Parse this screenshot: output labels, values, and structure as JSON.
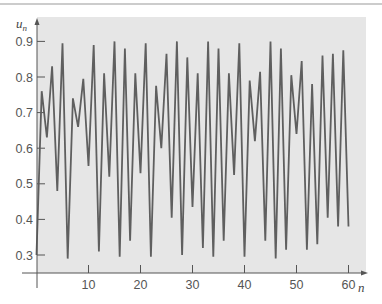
{
  "page": {
    "header_rule_color": "#9a9a9a"
  },
  "chart_data": {
    "type": "line",
    "title": "",
    "xlabel": "n",
    "ylabel": "u_n",
    "ylabel_main": "u",
    "ylabel_sub": "n",
    "xlim": [
      0,
      62
    ],
    "ylim": [
      0.25,
      0.96
    ],
    "x_ticks": [
      10,
      20,
      30,
      40,
      50,
      60
    ],
    "x_tick_labels": [
      "10",
      "20",
      "30",
      "40",
      "50",
      "60"
    ],
    "y_ticks": [
      0.3,
      0.4,
      0.5,
      0.6,
      0.7,
      0.8,
      0.9
    ],
    "y_tick_labels": [
      "0.3",
      "0.4",
      "0.5",
      "0.6",
      "0.7",
      "0.8",
      "0.9"
    ],
    "grid": false,
    "legend": null,
    "background_color": "#e6e6e6",
    "line_color": "#5f5f5f",
    "axis_color": "#555555",
    "series": [
      {
        "name": "u_n",
        "x": [
          0,
          1,
          2,
          3,
          4,
          5,
          6,
          7,
          8,
          9,
          10,
          11,
          12,
          13,
          14,
          15,
          16,
          17,
          18,
          19,
          20,
          21,
          22,
          23,
          24,
          25,
          26,
          27,
          28,
          29,
          30,
          31,
          32,
          33,
          34,
          35,
          36,
          37,
          38,
          39,
          40,
          41,
          42,
          43,
          44,
          45,
          46,
          47,
          48,
          49,
          50,
          51,
          52,
          53,
          54,
          55,
          56,
          57,
          58,
          59,
          60
        ],
        "values": [
          0.3,
          0.76,
          0.63,
          0.83,
          0.48,
          0.895,
          0.29,
          0.74,
          0.66,
          0.795,
          0.55,
          0.89,
          0.31,
          0.81,
          0.52,
          0.9,
          0.295,
          0.88,
          0.34,
          0.81,
          0.53,
          0.895,
          0.295,
          0.775,
          0.6,
          0.865,
          0.405,
          0.9,
          0.3,
          0.855,
          0.435,
          0.81,
          0.32,
          0.9,
          0.295,
          0.88,
          0.34,
          0.81,
          0.525,
          0.895,
          0.295,
          0.79,
          0.62,
          0.815,
          0.34,
          0.9,
          0.29,
          0.88,
          0.315,
          0.805,
          0.64,
          0.845,
          0.315,
          0.78,
          0.33,
          0.86,
          0.405,
          0.865,
          0.38,
          0.875,
          0.38
        ]
      }
    ]
  }
}
